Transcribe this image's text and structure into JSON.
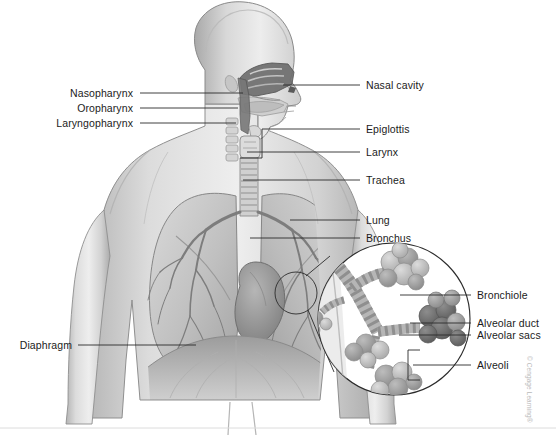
{
  "figure": {
    "credit": "© Cengage Learning®",
    "colors": {
      "background": "#ffffff",
      "leader_line": "#2b2b2b",
      "label_text": "#1b1b1b",
      "skin_light": "#e6e6e6",
      "skin_mid": "#c9c9c9",
      "skin_shadow": "#a8a8a8",
      "lung_light": "#d2d2d2",
      "lung_mid": "#b0b0b0",
      "airway_dark": "#6f6f6f",
      "cavity_dark": "#585858",
      "alveoli_dark": "#6a6a6a",
      "alveoli_mid": "#9a9a9a",
      "alveoli_light": "#c4c4c4",
      "credit_text": "#b9b9b9",
      "rule": "#dcdcdc"
    }
  },
  "labels_left": [
    {
      "id": "nasopharynx",
      "text": "Nasopharynx",
      "text_x": 133,
      "text_y": 88,
      "line_x1": 140,
      "line_x2": 243,
      "line_y": 93
    },
    {
      "id": "oropharynx",
      "text": "Oropharynx",
      "text_x": 133,
      "text_y": 103,
      "line_x1": 140,
      "line_x2": 238,
      "line_y": 108
    },
    {
      "id": "laryngopharynx",
      "text": "Laryngopharynx",
      "text_x": 133,
      "text_y": 118,
      "line_x1": 140,
      "line_x2": 236,
      "line_y": 123
    },
    {
      "id": "diaphragm",
      "text": "Diaphragm",
      "text_x": 72,
      "text_y": 340,
      "line_x1": 78,
      "line_x2": 196,
      "line_y": 345
    }
  ],
  "labels_right": [
    {
      "id": "nasal-cavity",
      "text": "Nasal cavity",
      "text_x": 366,
      "text_y": 80,
      "line_x1": 283,
      "line_x2": 360,
      "line_y": 85
    },
    {
      "id": "epiglottis",
      "text": "Epiglottis",
      "text_x": 366,
      "text_y": 124,
      "line_x1": 262,
      "line_x2": 360,
      "line_y": 129
    },
    {
      "id": "larynx",
      "text": "Larynx",
      "text_x": 366,
      "text_y": 147,
      "line_x1": 247,
      "line_x2": 360,
      "line_y": 152
    },
    {
      "id": "trachea",
      "text": "Trachea",
      "text_x": 366,
      "text_y": 175,
      "line_x1": 243,
      "line_x2": 360,
      "line_y": 180
    },
    {
      "id": "lung",
      "text": "Lung",
      "text_x": 366,
      "text_y": 215,
      "line_x1": 290,
      "line_x2": 360,
      "line_y": 220
    },
    {
      "id": "bronchus",
      "text": "Bronchus",
      "text_x": 366,
      "text_y": 233,
      "line_x1": 250,
      "line_x2": 360,
      "line_y": 238
    }
  ],
  "labels_inset": [
    {
      "id": "bronchiole",
      "text": "Bronchiole",
      "text_x": 477,
      "text_y": 290,
      "line_x1": 400,
      "line_x2": 471,
      "line_y": 295
    },
    {
      "id": "alveolar-duct",
      "text": "Alveolar duct",
      "text_x": 477,
      "text_y": 318,
      "line_x1": 410,
      "line_x2": 471,
      "line_y": 323
    },
    {
      "id": "alveolar-sacs",
      "text": "Alveolar sacs",
      "text_x": 477,
      "text_y": 330,
      "line_x1": 399,
      "line_x2": 471,
      "line_y": 335
    },
    {
      "id": "alveoli",
      "text": "Alveoli",
      "text_x": 477,
      "text_y": 360,
      "line_x1": 413,
      "line_x2": 471,
      "line_y": 365
    }
  ]
}
